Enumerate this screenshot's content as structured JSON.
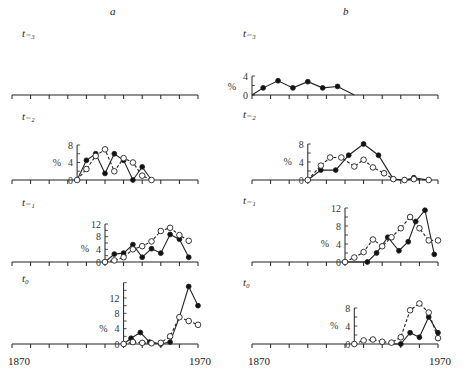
{
  "columns": [
    {
      "label": "a"
    },
    {
      "label": "b"
    }
  ],
  "rows": [
    {
      "label": "t₋₃"
    },
    {
      "label": "t₋₂"
    },
    {
      "label": "t₋₁"
    },
    {
      "label": "t₀"
    }
  ],
  "x_axis": {
    "start_label": "1870",
    "end_label": "1970"
  },
  "y_unit": "%",
  "chart_data": {
    "type": "line",
    "title": "",
    "xlabel": "Year (1870–1970)",
    "ylabel": "%",
    "xlim": [
      1870,
      1970
    ],
    "legend": {
      "filled": "series 1 (solid line, filled circles)",
      "open": "series 2 (dashed line, open circles)"
    },
    "panels": [
      {
        "column": "a",
        "row": "t-3",
        "empty": true,
        "series": []
      },
      {
        "column": "a",
        "row": "t-2",
        "ylim": [
          0,
          8
        ],
        "yticks": [
          0,
          4,
          8
        ],
        "series": [
          {
            "name": "filled",
            "x": [
              1905,
              1910,
              1915,
              1920,
              1925,
              1930,
              1935,
              1940,
              1945
            ],
            "y": [
              0,
              4.5,
              6,
              1.5,
              6,
              4.5,
              0,
              3,
              0
            ]
          },
          {
            "name": "open",
            "x": [
              1905,
              1910,
              1915,
              1920,
              1925,
              1930,
              1935,
              1940,
              1945
            ],
            "y": [
              0,
              2.5,
              5.5,
              7,
              2,
              5,
              4,
              1,
              0
            ]
          }
        ]
      },
      {
        "column": "a",
        "row": "t-1",
        "ylim": [
          0,
          12
        ],
        "yticks": [
          0,
          4,
          8,
          12
        ],
        "series": [
          {
            "name": "filled",
            "x": [
              1920,
              1925,
              1930,
              1935,
              1940,
              1945,
              1950,
              1955,
              1960,
              1965
            ],
            "y": [
              0,
              2.5,
              2.8,
              5.5,
              1.5,
              4.2,
              2.8,
              8.7,
              7.2,
              1.5
            ]
          },
          {
            "name": "open",
            "x": [
              1920,
              1925,
              1930,
              1935,
              1940,
              1945,
              1950,
              1955,
              1960,
              1965
            ],
            "y": [
              0,
              0.5,
              1.5,
              4,
              5,
              6.5,
              9.8,
              10.8,
              8.5,
              6.7
            ]
          }
        ]
      },
      {
        "column": "a",
        "row": "t0",
        "ylim": [
          0,
          16
        ],
        "yticks": [
          0,
          4,
          8,
          12
        ],
        "series": [
          {
            "name": "filled",
            "x": [
              1930,
              1934,
              1939,
              1944,
              1950,
              1955,
              1960,
              1965,
              1970
            ],
            "y": [
              0,
              1.5,
              3,
              0.5,
              0,
              0.5,
              7,
              15,
              10
            ]
          },
          {
            "name": "open",
            "x": [
              1930,
              1935,
              1940,
              1945,
              1950,
              1955,
              1960,
              1965,
              1970
            ],
            "y": [
              0,
              0.5,
              0.3,
              0.2,
              0.3,
              2,
              7,
              6,
              5
            ]
          }
        ]
      },
      {
        "column": "b",
        "row": "t-3",
        "ylim": [
          0,
          4
        ],
        "yticks": [
          0,
          4
        ],
        "series": [
          {
            "name": "filled",
            "x": [
              1870,
              1876,
              1884,
              1892,
              1900,
              1908,
              1916,
              1925
            ],
            "y": [
              0,
              1.5,
              3,
              1.5,
              2.8,
              1.5,
              1.8,
              0
            ]
          }
        ]
      },
      {
        "column": "b",
        "row": "t-2",
        "ylim": [
          0,
          8
        ],
        "yticks": [
          0,
          4,
          8
        ],
        "series": [
          {
            "name": "filled",
            "x": [
              1900,
              1907,
              1915,
              1922,
              1930,
              1938,
              1946,
              1952,
              1957,
              1965
            ],
            "y": [
              0,
              2.2,
              2.2,
              5.5,
              8,
              5.5,
              0.2,
              0,
              0.5,
              0
            ]
          },
          {
            "name": "open",
            "x": [
              1900,
              1907,
              1912,
              1918,
              1925,
              1930,
              1935,
              1941,
              1946,
              1952,
              1957,
              1965
            ],
            "y": [
              0,
              3.2,
              5,
              5,
              3,
              4.5,
              2.8,
              1.5,
              0.2,
              0,
              0.2,
              0
            ]
          }
        ]
      },
      {
        "column": "b",
        "row": "t-1",
        "ylim": [
          0,
          12
        ],
        "yticks": [
          0,
          4,
          8,
          12
        ],
        "series": [
          {
            "name": "filled",
            "x": [
              1920,
              1932,
              1937,
              1943,
              1949,
              1954,
              1958,
              1963,
              1968
            ],
            "y": [
              0,
              0,
              2,
              5.5,
              2.5,
              4.5,
              9,
              11.5,
              1.7
            ]
          },
          {
            "name": "open",
            "x": [
              1920,
              1925,
              1930,
              1935,
              1940,
              1945,
              1950,
              1955,
              1960,
              1965,
              1970
            ],
            "y": [
              0,
              1,
              2.2,
              5,
              3.5,
              5.5,
              7.5,
              10,
              7.5,
              4.8,
              4.8
            ]
          }
        ]
      },
      {
        "column": "b",
        "row": "t0",
        "ylim": [
          0,
          8
        ],
        "yticks": [
          0,
          4,
          8
        ],
        "series": [
          {
            "name": "filled",
            "x": [
              1945,
              1950,
              1955,
              1960,
              1965,
              1970
            ],
            "y": [
              0,
              0,
              2.5,
              1.5,
              6,
              2.5
            ]
          },
          {
            "name": "open",
            "x": [
              1925,
              1930,
              1935,
              1940,
              1945,
              1950,
              1955,
              1960,
              1965,
              1970
            ],
            "y": [
              0,
              0.8,
              1,
              0.5,
              0.3,
              1.5,
              7.5,
              9,
              7,
              1.3
            ]
          }
        ]
      }
    ]
  }
}
